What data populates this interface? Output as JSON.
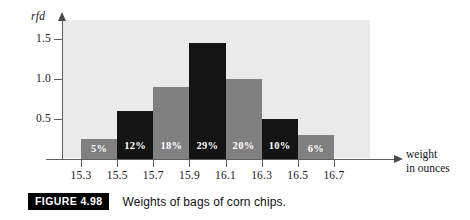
{
  "figure": {
    "badge": "FIGURE 4.98",
    "caption": "Weights of bags of corn chips."
  },
  "axes": {
    "y_title": "rfd",
    "x_title_line1": "weight",
    "x_title_line2": "in ounces",
    "y_ticks": [
      "0.5",
      "1.0",
      "1.5"
    ],
    "x_ticks": [
      "15.3",
      "15.5",
      "15.7",
      "15.9",
      "16.1",
      "16.3",
      "16.5",
      "16.7"
    ]
  },
  "colors": {
    "bar_gray": "#808080",
    "bar_black": "#141414",
    "plot_background": "#ebeaea",
    "axis": "#5d5d5d",
    "label_text": "#ffffff",
    "badge_background": "#000000"
  },
  "chart_data": {
    "type": "bar",
    "title": "Weights of bags of corn chips.",
    "xlabel": "weight in ounces",
    "ylabel": "rfd",
    "categories": [
      "15.3-15.5",
      "15.5-15.7",
      "15.7-15.9",
      "15.9-16.1",
      "16.1-16.3",
      "16.3-16.5",
      "16.5-16.7"
    ],
    "bin_edges": [
      15.3,
      15.5,
      15.7,
      15.9,
      16.1,
      16.3,
      16.5,
      16.7
    ],
    "bin_width": 0.2,
    "values": [
      0.25,
      0.6,
      0.9,
      1.45,
      1.0,
      0.5,
      0.3
    ],
    "data_labels": [
      "5%",
      "12%",
      "18%",
      "29%",
      "20%",
      "10%",
      "6%"
    ],
    "percentages": [
      5,
      12,
      18,
      29,
      20,
      10,
      6
    ],
    "bar_colors": [
      "#808080",
      "#141414",
      "#808080",
      "#141414",
      "#808080",
      "#141414",
      "#808080"
    ],
    "xlim": [
      15.2,
      16.9
    ],
    "ylim": [
      0,
      1.74
    ],
    "ytick_values": [
      0.5,
      1.0,
      1.5
    ],
    "xtick_values": [
      15.3,
      15.5,
      15.7,
      15.9,
      16.1,
      16.3,
      16.5,
      16.7
    ],
    "grid": false,
    "legend": "none"
  }
}
